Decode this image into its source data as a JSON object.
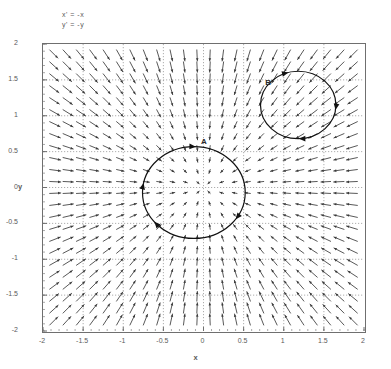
{
  "equations": {
    "line1": "x' = -x",
    "line2": "y' = -y"
  },
  "axes": {
    "xlabel": "x",
    "ylabel": "y",
    "xticks": [
      "-2",
      "-1.5",
      "-1",
      "-0.5",
      "0",
      "0.5",
      "1",
      "1.5",
      "2"
    ],
    "yticks": [
      "2",
      "1.5",
      "1",
      "0.5",
      "0",
      "-0.5",
      "-1",
      "-1.5",
      "-2"
    ],
    "xlim": [
      -2,
      2
    ],
    "ylim": [
      -2,
      2
    ]
  },
  "trajectories": [
    {
      "label": "A",
      "cx": -0.12,
      "cy": -0.07,
      "r": 0.64
    },
    {
      "label": "B",
      "cx": 1.18,
      "cy": 1.15,
      "r": 0.47
    }
  ],
  "colors": {
    "frame": "#6f6f6f",
    "grid": "#8a8a8a",
    "arrow": "#3a3a3a",
    "text": "#5a5a5a",
    "trajectory": "#111111",
    "background": "#ffffff"
  },
  "chart_data": {
    "type": "scatter",
    "title": "",
    "subtitle": "",
    "xlabel": "x",
    "ylabel": "y",
    "xlim": [
      -2,
      2
    ],
    "ylim": [
      -2,
      2
    ],
    "grid": true,
    "legend": "none",
    "plot_kind": "vector-field-phase-portrait",
    "system": {
      "xdot": "-x",
      "ydot": "-y"
    },
    "fixed_point": {
      "x": 0,
      "y": 0,
      "classification": "stable node"
    },
    "field_grid": {
      "x_start": -2,
      "x_end": 2,
      "x_step": 0.16,
      "y_start": -2,
      "y_end": 2,
      "y_step": 0.16,
      "rule": "arrow at (x,y) points along (-x,-y), i.e. directly toward the origin; length scales with distance from origin"
    },
    "annotations": [
      {
        "text": "x' = -x",
        "x": -1.75,
        "y": 2.3
      },
      {
        "text": "y' = -y",
        "x": -1.75,
        "y": 2.16
      },
      {
        "text": "A",
        "x": 0.02,
        "y": 0.62
      },
      {
        "text": "B",
        "x": 0.82,
        "y": 1.44
      }
    ],
    "series": [
      {
        "name": "A",
        "kind": "closed-orbit-circle",
        "center": [
          -0.12,
          -0.07
        ],
        "radius": 0.64,
        "arrow_directions": "clockwise markers at top-left, top-right, left, bottom"
      },
      {
        "name": "B",
        "kind": "closed-orbit-circle",
        "center": [
          1.18,
          1.15
        ],
        "radius": 0.47,
        "arrow_directions": "clockwise markers at top, right, bottom"
      }
    ]
  }
}
